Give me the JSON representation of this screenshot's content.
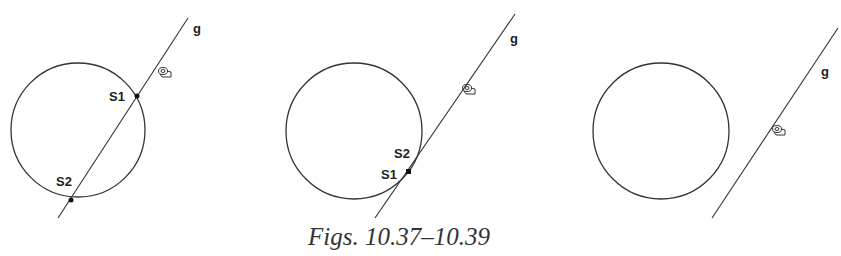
{
  "caption": "Figs. 10.37–10.39",
  "figures": [
    {
      "id": "10.37",
      "line_label": "g",
      "intersection_points": [
        "S1",
        "S2"
      ],
      "relation": "secant"
    },
    {
      "id": "10.38",
      "line_label": "g",
      "intersection_points": [
        "S2",
        "S1"
      ],
      "relation": "tangent"
    },
    {
      "id": "10.39",
      "line_label": "g",
      "intersection_points": [],
      "relation": "disjoint"
    }
  ],
  "icons": {
    "cursor": "hand-pointer-icon"
  },
  "colors": {
    "stroke": "#333333",
    "background": "#ffffff"
  }
}
